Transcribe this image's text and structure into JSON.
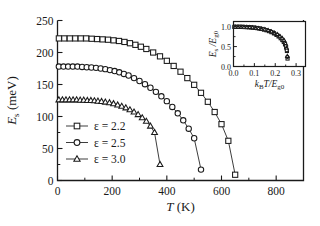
{
  "figure": {
    "background": "#ffffff",
    "line_color": "#1a1a1a"
  },
  "main_axes": {
    "xlabel": "T (K)",
    "ylabel": "Es (meV)",
    "ylabel_parts": {
      "sym": "E",
      "sub": "s",
      "unit": " (meV)"
    },
    "xlabel_parts": {
      "sym": "T",
      "unit": " (K)"
    },
    "xticks": [
      0,
      200,
      400,
      600,
      800
    ],
    "xtick_labels": [
      "0",
      "200",
      "400",
      "600",
      "800"
    ],
    "yticks": [
      0,
      50,
      100,
      150,
      200,
      250
    ],
    "ytick_labels": [
      "0",
      "50",
      "100",
      "150",
      "200",
      "250"
    ],
    "xlim": [
      0,
      900
    ],
    "ylim": [
      0,
      250
    ],
    "xminor_step": 100,
    "yminor_step": 25,
    "grid": false
  },
  "legend": {
    "position": "lower-left-inside",
    "entries": [
      {
        "marker": "square",
        "label": "ε = 2.2"
      },
      {
        "marker": "circle",
        "label": "ε = 2.5"
      },
      {
        "marker": "triangle",
        "label": "ε = 3.0"
      }
    ]
  },
  "inset_axes": {
    "xlabel": "kBT/Eg0",
    "ylabel": "Es /Eg0",
    "xlabel_parts": {
      "sym1": "k",
      "sub1": "B",
      "sym2": "T/E",
      "sub2": "g0"
    },
    "ylabel_parts": {
      "sym1": "E",
      "sub1": "s",
      "mid": " /E",
      "sub2": "g0"
    },
    "xticks": [
      0.0,
      0.1,
      0.2,
      0.3
    ],
    "xtick_labels": [
      "0.0",
      "0.1",
      "0.2",
      "0.3"
    ],
    "yticks": [
      0.0,
      0.5,
      1.0
    ],
    "ytick_labels": [
      "0.0",
      "0.5",
      "1.0"
    ],
    "xlim": [
      0,
      0.345
    ],
    "ylim": [
      0,
      1.13
    ],
    "grid": false
  },
  "chart_data": {
    "type": "line",
    "title": "",
    "xlabel": "T (K)",
    "ylabel": "Es (meV)",
    "xlim": [
      0,
      900
    ],
    "ylim": [
      0,
      250
    ],
    "grid": false,
    "legend_position": "lower-left",
    "series": [
      {
        "name": "ε = 2.2",
        "marker": "square",
        "filled": false,
        "x": [
          5,
          25,
          45,
          65,
          85,
          105,
          125,
          145,
          165,
          185,
          205,
          225,
          245,
          265,
          285,
          305,
          325,
          350,
          375,
          400,
          425,
          450,
          475,
          500,
          525,
          550,
          575,
          600,
          625,
          650
        ],
        "y": [
          222,
          222,
          222,
          222,
          222,
          222,
          221.5,
          221,
          220.5,
          220,
          219,
          218,
          216.5,
          214.5,
          212,
          209,
          205.5,
          200,
          194,
          187,
          179,
          170,
          160,
          149.5,
          137,
          123,
          107,
          88,
          62,
          9
        ]
      },
      {
        "name": "ε = 2.5",
        "marker": "circle",
        "filled": false,
        "x": [
          5,
          22,
          39,
          56,
          73,
          90,
          107,
          124,
          141,
          158,
          175,
          192,
          209,
          226,
          243,
          260,
          280,
          300,
          320,
          340,
          360,
          380,
          400,
          420,
          440,
          460,
          480,
          500,
          525
        ],
        "y": [
          178,
          178,
          178,
          178,
          178,
          177.5,
          177,
          176.5,
          176,
          175,
          174,
          172.5,
          171,
          169,
          166.5,
          164,
          160,
          155.5,
          150.5,
          145,
          138.5,
          131.5,
          124,
          115,
          105,
          94,
          81,
          66,
          17
        ]
      },
      {
        "name": "ε = 3.0",
        "marker": "triangle",
        "filled": false,
        "x": [
          5,
          18,
          31,
          44,
          57,
          70,
          83,
          96,
          109,
          122,
          135,
          148,
          161,
          175,
          190,
          205,
          220,
          235,
          250,
          265,
          280,
          295,
          310,
          325,
          340,
          355,
          375
        ],
        "y": [
          126,
          126,
          126,
          126,
          126,
          126,
          125.5,
          125.5,
          125,
          125,
          124.5,
          124,
          123.5,
          122.5,
          121.5,
          120,
          118,
          116,
          113.5,
          110.5,
          107,
          103,
          98,
          92.5,
          85,
          75,
          25
        ]
      }
    ]
  },
  "inset_data": {
    "type": "scatter",
    "xlabel": "kBT/Eg0",
    "ylabel": "Es/Eg0",
    "xlim": [
      0,
      0.345
    ],
    "ylim": [
      0,
      1.13
    ],
    "series": [
      {
        "name": "universal-curve-squares",
        "marker": "square",
        "x": [
          0.004,
          0.014,
          0.024,
          0.034,
          0.044,
          0.054,
          0.064,
          0.074,
          0.084,
          0.094,
          0.104,
          0.114,
          0.124,
          0.134,
          0.146,
          0.158,
          0.17,
          0.182,
          0.194,
          0.206,
          0.216,
          0.226,
          0.234,
          0.241,
          0.247,
          0.252,
          0.256,
          0.259
        ],
        "y": [
          0.995,
          0.995,
          0.995,
          0.995,
          0.993,
          0.991,
          0.989,
          0.986,
          0.982,
          0.977,
          0.971,
          0.963,
          0.954,
          0.943,
          0.928,
          0.91,
          0.888,
          0.862,
          0.831,
          0.793,
          0.755,
          0.71,
          0.665,
          0.615,
          0.555,
          0.485,
          0.39,
          0.2
        ]
      },
      {
        "name": "universal-curve-circles",
        "marker": "circle",
        "x": [
          0.006,
          0.018,
          0.03,
          0.042,
          0.054,
          0.066,
          0.078,
          0.09,
          0.102,
          0.114,
          0.126,
          0.14,
          0.154,
          0.168,
          0.182,
          0.196,
          0.208,
          0.22,
          0.23,
          0.239,
          0.246,
          0.251,
          0.255,
          0.258
        ],
        "y": [
          0.995,
          0.995,
          0.995,
          0.994,
          0.991,
          0.988,
          0.985,
          0.98,
          0.973,
          0.964,
          0.953,
          0.938,
          0.92,
          0.897,
          0.868,
          0.833,
          0.797,
          0.753,
          0.71,
          0.66,
          0.595,
          0.515,
          0.41,
          0.24
        ]
      },
      {
        "name": "universal-curve-triangles",
        "marker": "triangle",
        "x": [
          0.008,
          0.022,
          0.036,
          0.05,
          0.064,
          0.078,
          0.092,
          0.106,
          0.12,
          0.134,
          0.15,
          0.166,
          0.182,
          0.196,
          0.21,
          0.222,
          0.233,
          0.242,
          0.249,
          0.254,
          0.258
        ],
        "y": [
          0.995,
          0.995,
          0.994,
          0.992,
          0.989,
          0.985,
          0.979,
          0.971,
          0.96,
          0.947,
          0.929,
          0.907,
          0.878,
          0.845,
          0.807,
          0.765,
          0.715,
          0.655,
          0.58,
          0.47,
          0.26
        ]
      }
    ]
  }
}
